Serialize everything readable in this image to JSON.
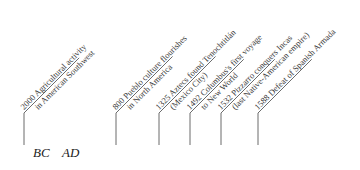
{
  "diagram": {
    "type": "timeline",
    "era_labels": {
      "bc": "BC",
      "ad": "AD"
    },
    "events": [
      {
        "x": 24,
        "line1": "2000 Agricultural activity",
        "line2": "in American Southwest",
        "len": 78
      },
      {
        "x": 116,
        "line1": "800 Pueblo culture flourishes",
        "line2": "in North America",
        "len": 80
      },
      {
        "x": 159,
        "line1": "1325 Aztecs found Tenochtitlán",
        "line2": "(Mexico City)",
        "len": 80
      },
      {
        "x": 190,
        "line1": "1492 Columbus's first voyage",
        "line2": "to New World",
        "len": 76
      },
      {
        "x": 221,
        "line1": "1532 Pizzarro conquers Incas",
        "line2": "(last Native-American empire)",
        "len": 76
      },
      {
        "x": 258,
        "line1": "1588 Defeat of Spanish Armada",
        "line2": "",
        "len": 76
      }
    ],
    "colors": {
      "line": "#6b6b6b",
      "text": "#3a3a3a"
    }
  }
}
